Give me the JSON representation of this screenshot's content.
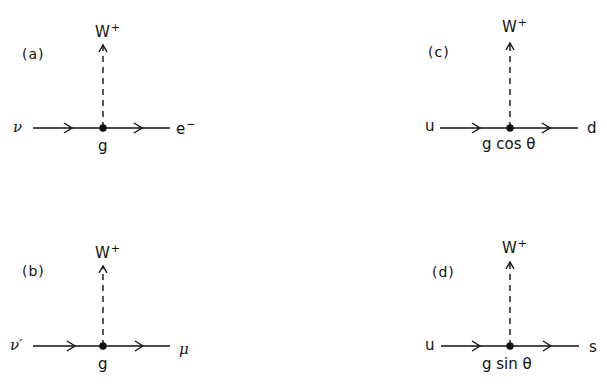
{
  "diagrams": [
    {
      "panel": "(a)",
      "boson": "W",
      "boson_charge": "+",
      "incoming": "ν",
      "outgoing": "e",
      "outgoing_charge": "−",
      "coupling": "g",
      "pos": {
        "vx": 103,
        "vy": 128,
        "x1": 33,
        "x2": 170,
        "wtop": 45
      }
    },
    {
      "panel": "(b)",
      "boson": "W",
      "boson_charge": "+",
      "incoming": "ν′",
      "outgoing": "μ",
      "outgoing_charge": "",
      "coupling": "g",
      "pos": {
        "vx": 103,
        "vy": 346,
        "x1": 33,
        "x2": 170,
        "wtop": 270
      }
    },
    {
      "panel": "(c)",
      "boson": "W",
      "boson_charge": "+",
      "incoming": "u",
      "outgoing": "d",
      "outgoing_charge": "",
      "coupling": "g cos θ",
      "pos": {
        "vx": 510,
        "vy": 128,
        "x1": 440,
        "x2": 578,
        "wtop": 42
      }
    },
    {
      "panel": "(d)",
      "boson": "W",
      "boson_charge": "+",
      "incoming": "u",
      "outgoing": "s",
      "outgoing_charge": "",
      "coupling": "g sin θ",
      "pos": {
        "vx": 510,
        "vy": 346,
        "x1": 440,
        "x2": 578,
        "wtop": 262
      }
    }
  ],
  "colors": {
    "ink": "#111111",
    "background": "#ffffff"
  }
}
